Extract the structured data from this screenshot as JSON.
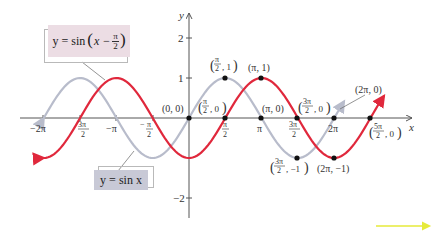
{
  "chart_data": {
    "type": "line",
    "title": "",
    "xlabel": "x",
    "ylabel": "y",
    "xlim": [
      -6.6,
      8.8
    ],
    "ylim": [
      -2.5,
      2.6
    ],
    "grid": false,
    "x_ticks": [
      "-2π",
      "-3π/2",
      "-π",
      "-π/2",
      "π/2",
      "π",
      "3π/2",
      "2π"
    ],
    "y_ticks": [
      "2",
      "1",
      "-2"
    ],
    "series": [
      {
        "name": "y = sin x",
        "color": "#b8bccb",
        "domain": [
          -6.283,
          6.71
        ],
        "function": "sin(x)",
        "x": [
          -6.283,
          -4.712,
          -3.142,
          -1.571,
          0,
          1.571,
          3.142,
          4.712,
          6.283
        ],
        "values": [
          0,
          1,
          0,
          -1,
          0,
          1,
          0,
          -1,
          0
        ]
      },
      {
        "name": "y = sin(x - π/2)",
        "color": "#e0283c",
        "domain": [
          -6.283,
          8.44
        ],
        "function": "sin(x - pi/2)",
        "x": [
          -6.283,
          -4.712,
          -3.142,
          -1.571,
          0,
          1.571,
          3.142,
          4.712,
          6.283,
          7.854
        ],
        "values": [
          -1,
          0,
          1,
          0,
          -1,
          0,
          1,
          0,
          -1,
          0
        ]
      }
    ],
    "annotations": [
      {
        "text": "(0, 0)",
        "x": 0,
        "y": 0
      },
      {
        "text": "(π/2, 0)",
        "x": 1.571,
        "y": 0
      },
      {
        "text": "(π/2, 1)",
        "x": 1.571,
        "y": 1
      },
      {
        "text": "(π, 1)",
        "x": 3.142,
        "y": 1
      },
      {
        "text": "(π, 0)",
        "x": 3.142,
        "y": 0
      },
      {
        "text": "(3π/2, 0)",
        "x": 4.712,
        "y": 0
      },
      {
        "text": "(2π, 0)",
        "x": 6.283,
        "y": 0
      },
      {
        "text": "(5π/2, 0)",
        "x": 7.854,
        "y": 0
      },
      {
        "text": "(3π/2, -1)",
        "x": 4.712,
        "y": -1
      },
      {
        "text": "(2π, -1)",
        "x": 6.283,
        "y": -1
      }
    ],
    "legend": [
      {
        "label": "y = sin(x − π/2)",
        "position": "top-left"
      },
      {
        "label": "y = sin x",
        "position": "bottom-left"
      }
    ]
  },
  "labels": {
    "shifted": {
      "prefix": "y = sin",
      "inner": "x −",
      "num": "π",
      "den": "2"
    },
    "base": "y = sin x",
    "axis_x": "x",
    "axis_y": "y",
    "ytick_2": "2",
    "ytick_1": "1",
    "ytick_m2": "−2",
    "xtick_m2pi": "−2π",
    "xtick_mpi": "−π",
    "xtick_pi": "π",
    "xtick_2pi": "2π",
    "pt_origin": "(0, 0)",
    "pt_pi_1": "(π, 1)",
    "pt_pi_0": "(π, 0)",
    "pt_2pi_0": "(2π, 0)",
    "pt_2pi_m1": "(2π, −1)"
  },
  "colors": {
    "shifted_curve": "#e0283c",
    "base_curve": "#b8bccb",
    "shifted_box": "#ecdde4",
    "base_box": "#c8c9d6",
    "axis": "#555555",
    "nav_arrow": "#e6ea3a"
  }
}
